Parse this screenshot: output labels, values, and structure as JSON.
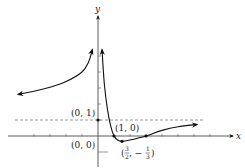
{
  "chart_data": {
    "type": "line",
    "title": "",
    "xlabel": "x",
    "ylabel": "y",
    "grid": false,
    "xlim": [
      -6,
      8.5
    ],
    "ylim": [
      -1.9,
      6
    ],
    "asymptotes": {
      "horizontal": [
        {
          "y": 1,
          "style": "dashed"
        }
      ],
      "vertical": [
        {
          "x": 0
        }
      ]
    },
    "series": [
      {
        "name": "left-branch",
        "description": "x < 0, rises toward +infinity as x approaches 0 from the left; approaches horizontal asymptote y=1 from above as x goes to -infinity",
        "points": [
          [
            -5.0,
            2.6
          ],
          [
            -4.0,
            2.8
          ],
          [
            -3.0,
            3.05
          ],
          [
            -2.0,
            3.4
          ],
          [
            -1.0,
            4.0
          ],
          [
            -0.6,
            4.6
          ],
          [
            -0.35,
            5.4
          ]
        ]
      },
      {
        "name": "right-branch",
        "description": "x > 0, descends from +infinity, crosses x-axis at (1,0), minimum at (3/2, -1/3), crosses back up near x=3, approaches y=1 from below",
        "points": [
          [
            0.25,
            5.4
          ],
          [
            0.4,
            3.2
          ],
          [
            0.6,
            1.6
          ],
          [
            0.8,
            0.6
          ],
          [
            1.0,
            0.0
          ],
          [
            1.25,
            -0.27
          ],
          [
            1.5,
            -0.333
          ],
          [
            2.0,
            -0.25
          ],
          [
            3.0,
            0.0
          ],
          [
            4.0,
            0.35
          ],
          [
            5.0,
            0.58
          ],
          [
            6.2,
            0.72
          ]
        ]
      }
    ],
    "marked_points": [
      {
        "x": 0,
        "y": 1,
        "label": "(0, 1)"
      },
      {
        "x": 1,
        "y": 0,
        "label": "(1, 0)"
      },
      {
        "x": 1.5,
        "y": -0.333,
        "label_parts": {
          "open": "(",
          "num1": "3",
          "den1": "2",
          "sep": ", −",
          "num2": "1",
          "den2": "3",
          "close": ")"
        }
      },
      {
        "x": 3,
        "y": 0,
        "label": ""
      }
    ],
    "origin_label": "(0, 0)",
    "x_ticks": [
      -4,
      -3,
      -2,
      -1,
      1,
      2,
      3,
      4,
      5,
      6,
      7
    ],
    "y_ticks": [
      -1,
      1,
      2,
      3,
      4,
      5
    ]
  }
}
